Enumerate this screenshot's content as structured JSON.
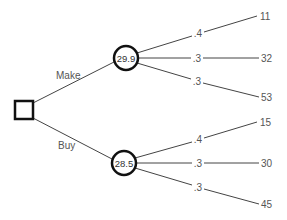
{
  "diagram": {
    "type": "decision-tree",
    "decision_node": {
      "shape": "square"
    },
    "branches": [
      {
        "label": "Make",
        "expected_value": "29.9",
        "outcomes": [
          {
            "probability": ".4",
            "value": "11"
          },
          {
            "probability": ".3",
            "value": "32"
          },
          {
            "probability": ".3",
            "value": "53"
          }
        ]
      },
      {
        "label": "Buy",
        "expected_value": "28.5",
        "outcomes": [
          {
            "probability": ".4",
            "value": "15"
          },
          {
            "probability": ".3",
            "value": "30"
          },
          {
            "probability": ".3",
            "value": "45"
          }
        ]
      }
    ]
  },
  "colors": {
    "line": "#444444",
    "text": "#555555",
    "node_stroke": "#111111"
  }
}
